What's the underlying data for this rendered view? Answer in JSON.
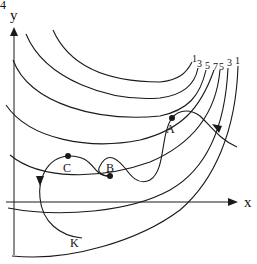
{
  "diagram": {
    "corner_mark": "4",
    "axes": {
      "x_label": "x",
      "y_label": "y"
    },
    "contour_labels": [
      "1",
      "3",
      "5",
      "7",
      "5",
      "3",
      "1"
    ],
    "points": [
      {
        "label": "A"
      },
      {
        "label": "B"
      },
      {
        "label": "C"
      },
      {
        "label": "K"
      }
    ],
    "colors": {
      "ink": "#1a1a1a",
      "background": "#ffffff"
    }
  }
}
